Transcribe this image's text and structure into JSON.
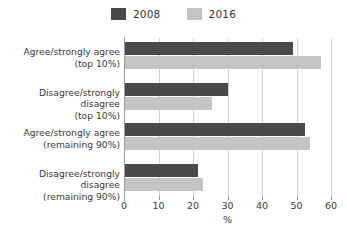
{
  "chart_data": {
    "type": "bar",
    "orientation": "horizontal",
    "title": "",
    "xlabel": "%",
    "ylabel": "",
    "xlim": [
      0,
      60
    ],
    "xticks": [
      0,
      10,
      20,
      30,
      40,
      50,
      60
    ],
    "grid": true,
    "legend_position": "top-center",
    "categories": [
      "Agree/strongly agree (top 10%)",
      "Disagree/strongly disagree (top 10%)",
      "Agree/strongly agree (remaining 90%)",
      "Disagree/strongly disagree (remaining 90%)"
    ],
    "category_lines": [
      {
        "line1": "Agree/strongly agree",
        "line2": "(top 10%)"
      },
      {
        "line1": "Disagree/strongly disagree",
        "line2": "(top 10%)"
      },
      {
        "line1": "Agree/strongly agree",
        "line2": "(remaining 90%)"
      },
      {
        "line1": "Disagree/strongly disagree",
        "line2": "(remaining 90%)"
      }
    ],
    "series": [
      {
        "name": "2008",
        "color": "#4a4a4a",
        "values": [
          49,
          30,
          52.5,
          21.5
        ]
      },
      {
        "name": "2016",
        "color": "#c4c4c4",
        "values": [
          57,
          25.5,
          54,
          23
        ]
      }
    ]
  },
  "legend": {
    "entries": [
      {
        "label": "2008",
        "color": "#4a4a4a"
      },
      {
        "label": "2016",
        "color": "#c4c4c4"
      }
    ]
  },
  "axis": {
    "x_label": "%",
    "tick_labels": [
      "0",
      "10",
      "20",
      "30",
      "40",
      "50",
      "60"
    ]
  },
  "colors": {
    "background": "#ffffff",
    "gridline": "#d2d2d2",
    "axis_line": "#9a9a9a",
    "text": "#3a3a3a",
    "series_2008": "#4a4a4a",
    "series_2016": "#c4c4c4"
  }
}
